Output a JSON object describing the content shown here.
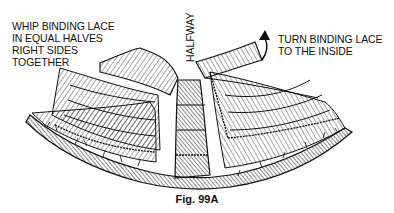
{
  "figure": {
    "caption": "Fig. 99A",
    "labels": {
      "left": [
        "WHIP BINDING LACE",
        "IN EQUAL HALVES",
        "RIGHT SIDES",
        "TOGETHER"
      ],
      "right": [
        "TURN BINDING LACE",
        "TO THE INSIDE"
      ],
      "center_vertical": "HALFWAY"
    },
    "icons": [
      "curved-arrow-icon"
    ],
    "colors": {
      "ink": "#111111",
      "background": "#ffffff"
    }
  }
}
